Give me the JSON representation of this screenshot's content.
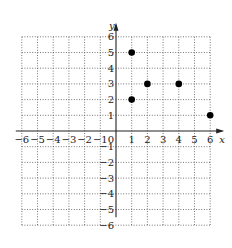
{
  "chart_data": {
    "type": "scatter",
    "title": "",
    "xlabel": "x",
    "ylabel": "y",
    "xlim": [
      -6,
      6
    ],
    "ylim": [
      -6,
      6
    ],
    "grid": true,
    "grid_style": "dotted",
    "x_ticks": [
      "-6",
      "-5",
      "-4",
      "-3",
      "-2",
      "-1",
      "0",
      "1",
      "2",
      "3",
      "4",
      "5",
      "6"
    ],
    "y_ticks": [
      "6",
      "5",
      "4",
      "3",
      "2",
      "1",
      "-1",
      "-2",
      "-3",
      "-4",
      "-5",
      "-6"
    ],
    "points": [
      {
        "x": 1,
        "y": 5
      },
      {
        "x": 1,
        "y": 2
      },
      {
        "x": 2,
        "y": 3
      },
      {
        "x": 4,
        "y": 3
      },
      {
        "x": 6,
        "y": 1
      }
    ],
    "marker": "filled-circle",
    "color": "#000000"
  }
}
